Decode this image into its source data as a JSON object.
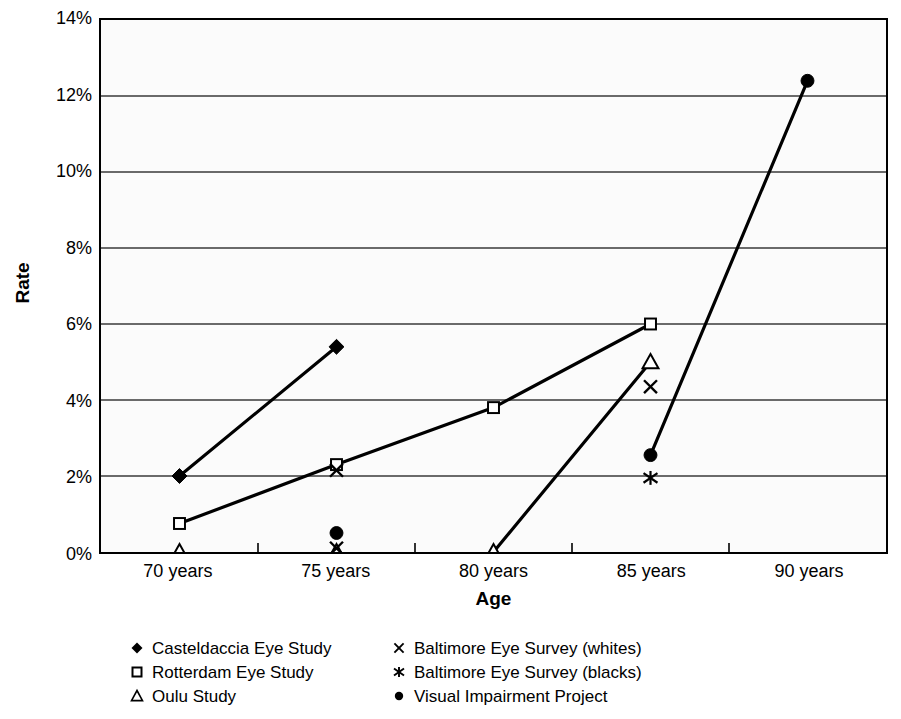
{
  "chart_data": {
    "type": "line",
    "title": "",
    "xlabel": "Age",
    "ylabel": "Rate",
    "categories": [
      "70 years",
      "75 years",
      "80 years",
      "85 years",
      "90 years"
    ],
    "x": [
      70,
      75,
      80,
      85,
      90
    ],
    "ylim": [
      0,
      14
    ],
    "yticks": [
      0,
      2,
      4,
      6,
      8,
      10,
      12,
      14
    ],
    "ytick_labels": [
      "0%",
      "2%",
      "4%",
      "6%",
      "8%",
      "10%",
      "12%",
      "14%"
    ],
    "grid": "horizontal",
    "legend_position": "below",
    "series": [
      {
        "name": "Casteldaccia Eye Study",
        "marker": "filled-diamond",
        "connected": true,
        "points": [
          {
            "x": 70,
            "y": 2.0
          },
          {
            "x": 75,
            "y": 5.4
          }
        ]
      },
      {
        "name": "Rotterdam Eye Study",
        "marker": "open-square",
        "connected": true,
        "points": [
          {
            "x": 70,
            "y": 0.75
          },
          {
            "x": 75,
            "y": 2.3
          },
          {
            "x": 80,
            "y": 3.8
          },
          {
            "x": 85,
            "y": 6.0
          }
        ]
      },
      {
        "name": "Oulu Study",
        "marker": "open-triangle",
        "connected": true,
        "points": [
          {
            "x": 70,
            "y": 0.0
          },
          {
            "x": 75,
            "y": 0.0
          },
          {
            "x": 80,
            "y": 0.0
          },
          {
            "x": 85,
            "y": 5.0
          }
        ]
      },
      {
        "name": "Baltimore Eye Survey (whites)",
        "marker": "cross-x",
        "connected": false,
        "points": [
          {
            "x": 75,
            "y": 0.1
          },
          {
            "x": 75,
            "y": 2.15
          },
          {
            "x": 85,
            "y": 4.35
          }
        ]
      },
      {
        "name": "Baltimore Eye Survey (blacks)",
        "marker": "asterisk",
        "connected": false,
        "points": [
          {
            "x": 85,
            "y": 1.95
          }
        ]
      },
      {
        "name": "Visual Impairment Project",
        "marker": "filled-circle",
        "connected": true,
        "points": [
          {
            "x": 75,
            "y": 0.5
          },
          {
            "x": 85,
            "y": 2.55
          },
          {
            "x": 90,
            "y": 12.4
          }
        ],
        "segments": [
          [
            85,
            90
          ]
        ]
      }
    ]
  },
  "axes": {
    "y_title": "Rate",
    "x_title": "Age",
    "y_tick_labels": [
      "14%",
      "12%",
      "10%",
      "8%",
      "6%",
      "4%",
      "2%",
      "0%"
    ],
    "x_tick_labels": [
      "70 years",
      "75 years",
      "80 years",
      "85 years",
      "90 years"
    ]
  },
  "legend": {
    "left_column": [
      {
        "marker": "filled-diamond",
        "label": "Casteldaccia Eye Study"
      },
      {
        "marker": "open-square",
        "label": "Rotterdam Eye Study"
      },
      {
        "marker": "open-triangle",
        "label": "Oulu Study"
      }
    ],
    "right_column": [
      {
        "marker": "cross-x",
        "label": "Baltimore Eye Survey (whites)"
      },
      {
        "marker": "asterisk",
        "label": "Baltimore Eye Survey (blacks)"
      },
      {
        "marker": "filled-circle",
        "label": "Visual Impairment Project"
      }
    ]
  },
  "colors": {
    "ink": "#000000",
    "plot_background": "#fbfbfb",
    "gridline": "#3a3a3a",
    "page_background": "#ffffff"
  }
}
